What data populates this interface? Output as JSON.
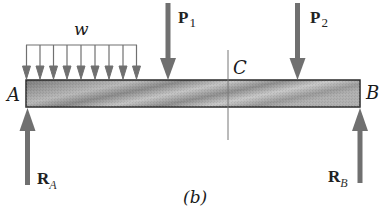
{
  "figure": {
    "caption": "(b)",
    "beam": {
      "left_end_label": "A",
      "right_end_label": "B",
      "section_label": "C",
      "fill_light": "#c8c8c8",
      "fill_dark": "#6a6a6a",
      "border_color": "#2a2a2a"
    },
    "loads": {
      "distributed": {
        "label": "w",
        "arrow_count": 9
      },
      "point_1": {
        "label": "P",
        "subscript": "1"
      },
      "point_2": {
        "label": "P",
        "subscript": "2"
      }
    },
    "reactions": {
      "left": {
        "label": "R",
        "subscript": "A"
      },
      "right": {
        "label": "R",
        "subscript": "B"
      }
    },
    "arrow_color": "#707070"
  }
}
